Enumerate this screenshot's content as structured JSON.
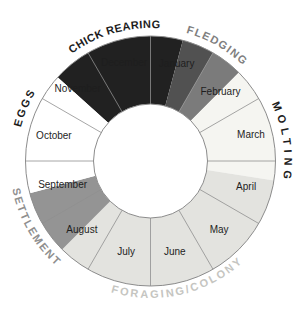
{
  "figure": {
    "background": "#ffffff",
    "geometry": {
      "viewbox_w": 301,
      "viewbox_h": 312,
      "cx": 150.5,
      "cy": 161,
      "outer_r": 125,
      "inner_r": 57
    },
    "style": {
      "divider_color": "#8f8f8f",
      "divider_width": 0.8,
      "outline_color": "#8c8c8c",
      "outline_width": 1,
      "month_label_color": "#1e1e1e",
      "month_font_size": 10,
      "phase_font_size": 11
    },
    "months": [
      {
        "label": "January",
        "mid_deg": 15,
        "label_r": 101
      },
      {
        "label": "February",
        "mid_deg": 45,
        "label_r": 99
      },
      {
        "label": "March",
        "mid_deg": 75,
        "label_r": 104
      },
      {
        "label": "April",
        "mid_deg": 105,
        "label_r": 99
      },
      {
        "label": "May",
        "mid_deg": 135,
        "label_r": 97
      },
      {
        "label": "June",
        "mid_deg": 165,
        "label_r": 94
      },
      {
        "label": "July",
        "mid_deg": 195,
        "label_r": 94
      },
      {
        "label": "August",
        "mid_deg": 225,
        "label_r": 97
      },
      {
        "label": "September",
        "mid_deg": 255,
        "label_r": 91
      },
      {
        "label": "October",
        "mid_deg": 285,
        "label_r": 100
      },
      {
        "label": "November",
        "mid_deg": 315,
        "label_r": 103
      },
      {
        "label": "December",
        "mid_deg": 345,
        "label_r": 102
      }
    ],
    "phases": [
      {
        "label": "CHICK REARING",
        "start_deg": 312,
        "end_deg": 375,
        "fill": "#212121",
        "label_color": "#1c1c1c",
        "label_mid_deg": 344,
        "label_r": 133,
        "side": "top",
        "letter_spacing": 0.4
      },
      {
        "label": "FLEDGING",
        "start_deg": 15,
        "end_deg": 45,
        "fill": "#5e5e5e",
        "fill_stops": [
          {
            "from": 15,
            "to": 30,
            "color": "#515151"
          },
          {
            "from": 30,
            "to": 45,
            "color": "#7b7b7b"
          }
        ],
        "label_color": "#7f7f7f",
        "label_mid_deg": 30,
        "label_r": 133,
        "side": "top",
        "letter_spacing": 1.3
      },
      {
        "label": "MOLTING",
        "start_deg": 45,
        "end_deg": 99,
        "fill": "#f5f5f1",
        "label_color": "#1c1c1c",
        "label_mid_deg": 82,
        "label_r": 134,
        "side": "top",
        "letter_spacing": 4.5
      },
      {
        "label": "FORAGING/COLONY",
        "start_deg": 99,
        "end_deg": 225,
        "fill": "#e3e3df",
        "label_color": "#c5c5c1",
        "label_mid_deg": 167,
        "label_r": 137,
        "side": "bottom",
        "letter_spacing": 2.2
      },
      {
        "label": "SETTLEMENT",
        "start_deg": 225,
        "end_deg": 255,
        "fill": "#949494",
        "label_color": "#8f8f8f",
        "label_mid_deg": 240,
        "label_r": 141,
        "side": "bottom",
        "letter_spacing": 1.8
      },
      {
        "label": "EGGS",
        "start_deg": 255,
        "end_deg": 312,
        "fill": "#ffffff",
        "label_color": "#1c1c1c",
        "label_mid_deg": 293,
        "label_r": 134,
        "side": "top",
        "letter_spacing": 2
      }
    ]
  },
  "chart_data": {
    "type": "donut-cycle",
    "title": "",
    "categories": [
      "January",
      "February",
      "March",
      "April",
      "May",
      "June",
      "July",
      "August",
      "September",
      "October",
      "November",
      "December"
    ],
    "segment_arc_deg": 30,
    "ring": {
      "outer_r_px": 125,
      "inner_r_px": 57
    },
    "phases": [
      {
        "name": "EGGS",
        "span": "mid-September to mid-November",
        "arc_deg": [
          255,
          312
        ],
        "color": "#ffffff"
      },
      {
        "name": "CHICK REARING",
        "span": "mid-November to mid-January",
        "arc_deg": [
          312,
          375
        ],
        "color": "#212121"
      },
      {
        "name": "FLEDGING",
        "span": "mid-January to mid-February",
        "arc_deg": [
          15,
          45
        ],
        "color": "#5e5e5e"
      },
      {
        "name": "MOLTING",
        "span": "mid-February to early April",
        "arc_deg": [
          45,
          99
        ],
        "color": "#f5f5f1"
      },
      {
        "name": "FORAGING/COLONY",
        "span": "early April to mid-August",
        "arc_deg": [
          99,
          225
        ],
        "color": "#e3e3df"
      },
      {
        "name": "SETTLEMENT",
        "span": "mid-August to mid-September",
        "arc_deg": [
          225,
          255
        ],
        "color": "#949494"
      }
    ]
  }
}
